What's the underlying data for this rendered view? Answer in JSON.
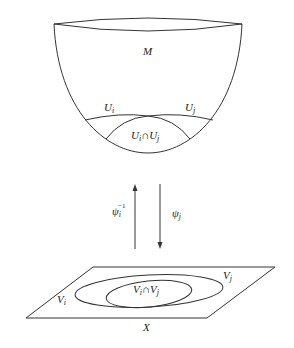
{
  "diagram": {
    "manifold_label": "M",
    "open_set_i_label": "U",
    "open_set_i_sub": "i",
    "open_set_j_label": "U",
    "open_set_j_sub": "j",
    "intersection_U": {
      "a": "U",
      "a_sub": "i",
      "op": "∩",
      "b": "U",
      "b_sub": "j"
    },
    "map_inverse_label": "ψ",
    "map_inverse_sub": "i",
    "map_inverse_sup": "−1",
    "map_label": "ψ",
    "map_sub": "j",
    "space_label": "X",
    "image_i_label": "V",
    "image_i_sub": "i",
    "image_j_label": "V",
    "image_j_sub": "j",
    "intersection_V": {
      "a": "V",
      "a_sub": "i",
      "op": "∩",
      "b": "V",
      "b_sub": "j"
    },
    "colors": {
      "stroke": "#333333",
      "text": "#222222",
      "background": "#ffffff"
    }
  }
}
